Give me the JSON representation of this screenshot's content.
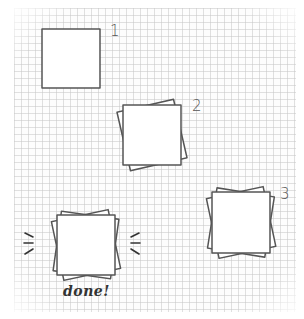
{
  "diagram": {
    "steps": [
      {
        "label": "1",
        "sheets": 1
      },
      {
        "label": "2",
        "sheets": 2
      },
      {
        "label": "3",
        "sheets": 3
      }
    ],
    "final": {
      "label": "done!",
      "sheets": 3,
      "emphasis": "radiating-lines"
    }
  },
  "colors": {
    "stroke": "#555555",
    "grid": "#c8c8c8",
    "text": "#333333"
  }
}
